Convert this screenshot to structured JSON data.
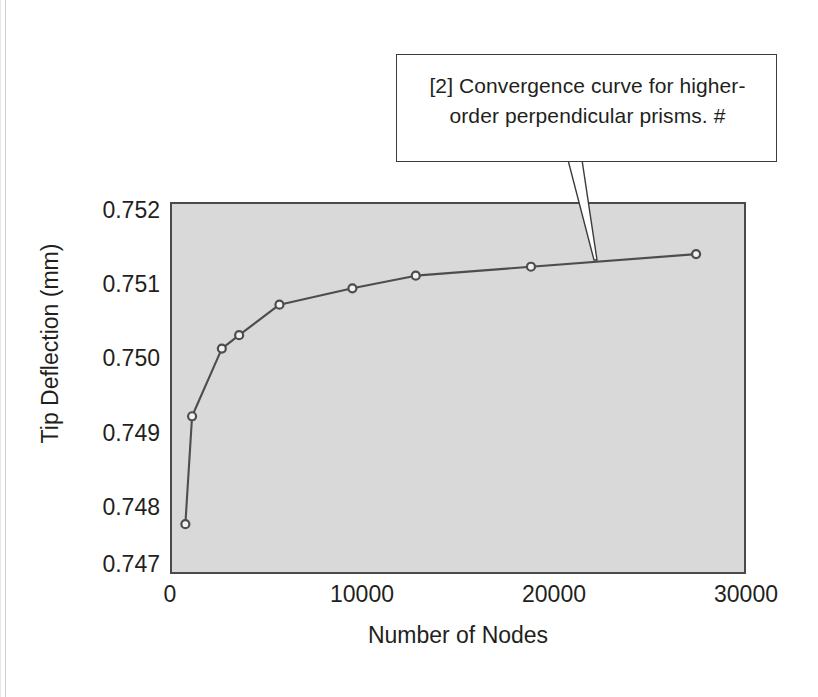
{
  "callout": {
    "line1": "[2] Convergence curve for higher-",
    "line2": "order perpendicular prisms.  #",
    "border_color": "#3b3b3b",
    "background": "#ffffff"
  },
  "chart_data": {
    "type": "line",
    "title": "",
    "xlabel": "Number of Nodes",
    "ylabel": "Tip Deflection (mm)",
    "xlim": [
      0,
      30000
    ],
    "ylim": [
      0.747,
      0.752
    ],
    "xticks": [
      "0",
      "10000",
      "20000",
      "30000"
    ],
    "xtick_values": [
      0,
      10000,
      20000,
      30000
    ],
    "yticks": [
      "0.747",
      "0.748",
      "0.749",
      "0.750",
      "0.751",
      "0.752"
    ],
    "ytick_values": [
      0.747,
      0.748,
      0.749,
      0.75,
      0.751,
      0.752
    ],
    "grid": false,
    "legend": "none",
    "plot_background": "#d9d9d9",
    "axis_color": "#4a4a4a",
    "line_color": "#4d4d4d",
    "marker_face": "#f2f2f2",
    "marker_edge": "#4d4d4d",
    "series": [
      {
        "name": "higher-order perpendicular prisms",
        "x": [
          800,
          1150,
          2700,
          3600,
          5700,
          9500,
          12800,
          18800,
          27400
        ],
        "y": [
          0.74767,
          0.74912,
          0.75003,
          0.75021,
          0.75062,
          0.75084,
          0.75101,
          0.75113,
          0.7513
        ]
      }
    ],
    "annotation": {
      "text": "[2] Convergence curve for higher-order perpendicular prisms.  #",
      "points_to_x": 22000,
      "points_to_y": 0.75118
    }
  }
}
